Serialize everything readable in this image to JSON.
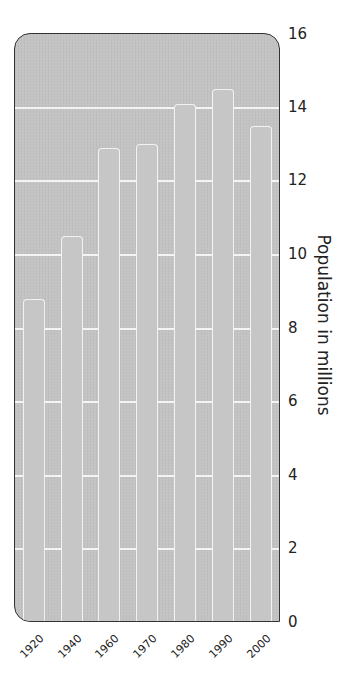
{
  "chart_data": {
    "type": "bar",
    "title": "",
    "xlabel": "",
    "ylabel": "Population in millions",
    "categories": [
      "1920",
      "1940",
      "1960",
      "1970",
      "1980",
      "1990",
      "2000"
    ],
    "values": [
      8.8,
      10.5,
      12.9,
      13.0,
      14.1,
      14.5,
      13.5
    ],
    "ylim": [
      0,
      16
    ],
    "yticks": [
      "0",
      "2",
      "4",
      "6",
      "8",
      "10",
      "12",
      "14",
      "16"
    ],
    "grid": true,
    "legend": null,
    "y_axis_position": "right"
  },
  "colors": {
    "panel": "#c3c3c3",
    "bar": "#c6c6c6",
    "bar_outline": "#f2f2f2",
    "gridline": "#f4f4f4",
    "text": "#222222"
  }
}
